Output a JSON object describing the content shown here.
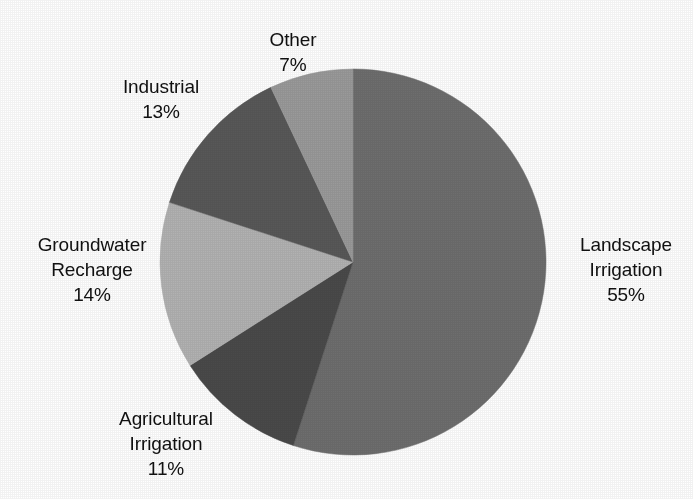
{
  "chart_data": {
    "type": "pie",
    "title": "",
    "subtitle": "",
    "xlabel": "",
    "ylabel": "",
    "legend_position": "none",
    "grid": false,
    "units": "percent",
    "value_suffix": "%",
    "start_angle_deg": 0,
    "direction": "clockwise",
    "center": {
      "x": 353,
      "y": 262
    },
    "radius": 193,
    "background_color": "#ffffff",
    "text_color": "#101010",
    "categories": [
      "Landscape Irrigation",
      "Agricultural Irrigation",
      "Groundwater Recharge",
      "Industrial",
      "Other"
    ],
    "values": [
      55,
      11,
      14,
      13,
      7
    ],
    "slices": [
      {
        "name": "Landscape Irrigation",
        "label_lines": [
          "Landscape",
          "Irrigation"
        ],
        "value": 55,
        "value_text": "55%",
        "color": "#6e6e6e",
        "start_deg": 0,
        "end_deg": 198
      },
      {
        "name": "Agricultural Irrigation",
        "label_lines": [
          "Agricultural",
          "Irrigation"
        ],
        "value": 11,
        "value_text": "11%",
        "color": "#4a4a4a",
        "start_deg": 198,
        "end_deg": 237.6
      },
      {
        "name": "Groundwater Recharge",
        "label_lines": [
          "Groundwater",
          "Recharge"
        ],
        "value": 14,
        "value_text": "14%",
        "color": "#b2b2b2",
        "start_deg": 237.6,
        "end_deg": 288
      },
      {
        "name": "Industrial",
        "label_lines": [
          "Industrial"
        ],
        "value": 13,
        "value_text": "13%",
        "color": "#585858",
        "start_deg": 288,
        "end_deg": 334.8
      },
      {
        "name": "Other",
        "label_lines": [
          "Other"
        ],
        "value": 7,
        "value_text": "7%",
        "color": "#9a9a9a",
        "start_deg": 334.8,
        "end_deg": 360
      }
    ]
  },
  "labels": {
    "other": {
      "line1": "Other",
      "pct": "7%"
    },
    "industrial": {
      "line1": "Industrial",
      "pct": "13%"
    },
    "groundwater": {
      "line1": "Groundwater",
      "line2": "Recharge",
      "pct": "14%"
    },
    "agricultural": {
      "line1": "Agricultural",
      "line2": "Irrigation",
      "pct": "11%"
    },
    "landscape": {
      "line1": "Landscape",
      "line2": "Irrigation",
      "pct": "55%"
    }
  }
}
